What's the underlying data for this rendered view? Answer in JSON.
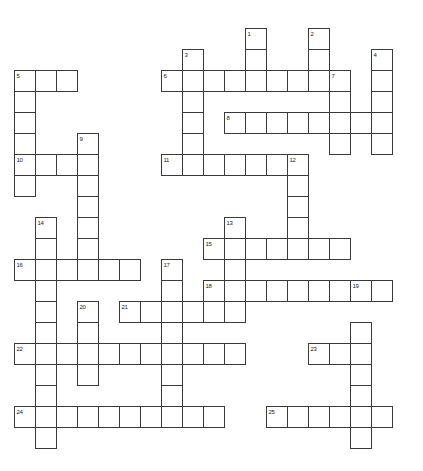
{
  "puzzle": {
    "title": "Crossword Puzzle Grid",
    "cell_size": 21,
    "origin_x": 14,
    "origin_y": 28,
    "grid_cols": 19,
    "grid_rows": 21,
    "border_color": "#3a3a3a",
    "cell_fill": "#ffffff",
    "background": "#ffffff",
    "number_color": "#1a1a1a",
    "entries": [
      {
        "number": "1",
        "direction": "down",
        "col": 11,
        "row": 0,
        "length": 2
      },
      {
        "number": "2",
        "direction": "down",
        "col": 14,
        "row": 0,
        "length": 2
      },
      {
        "number": "3",
        "direction": "down",
        "col": 8,
        "row": 1,
        "length": 5
      },
      {
        "number": "4",
        "direction": "down",
        "col": 17,
        "row": 1,
        "length": 5
      },
      {
        "number": "5",
        "direction": "across",
        "col": 0,
        "row": 2,
        "length": 3
      },
      {
        "number": "5d",
        "direction": "down",
        "col": 0,
        "row": 2,
        "length": 5
      },
      {
        "number": "6",
        "direction": "across",
        "col": 7,
        "row": 2,
        "length": 8
      },
      {
        "number": "7",
        "direction": "down",
        "col": 15,
        "row": 2,
        "length": 4
      },
      {
        "number": "8",
        "direction": "across",
        "col": 10,
        "row": 4,
        "length": 8
      },
      {
        "number": "9",
        "direction": "down",
        "col": 3,
        "row": 5,
        "length": 7
      },
      {
        "number": "10",
        "direction": "across",
        "col": 0,
        "row": 6,
        "length": 4
      },
      {
        "number": "11",
        "direction": "across",
        "col": 7,
        "row": 6,
        "length": 7
      },
      {
        "number": "12",
        "direction": "down",
        "col": 13,
        "row": 6,
        "length": 5
      },
      {
        "number": "13",
        "direction": "down",
        "col": 10,
        "row": 9,
        "length": 4
      },
      {
        "number": "14",
        "direction": "down",
        "col": 1,
        "row": 9,
        "length": 6
      },
      {
        "number": "15",
        "direction": "across",
        "col": 9,
        "row": 10,
        "length": 7
      },
      {
        "number": "16",
        "direction": "across",
        "col": 0,
        "row": 11,
        "length": 6
      },
      {
        "number": "17",
        "direction": "down",
        "col": 7,
        "row": 11,
        "length": 7
      },
      {
        "number": "18",
        "direction": "across",
        "col": 9,
        "row": 12,
        "length": 9
      },
      {
        "number": "19",
        "direction": "down",
        "col": 16,
        "row": 12,
        "length": 7
      },
      {
        "number": "20",
        "direction": "down",
        "col": 3,
        "row": 13,
        "length": 5
      },
      {
        "number": "21",
        "direction": "across",
        "col": 5,
        "row": 13,
        "length": 6
      },
      {
        "number": "22",
        "direction": "across",
        "col": 0,
        "row": 15,
        "length": 11
      },
      {
        "number": "23",
        "direction": "across",
        "col": 14,
        "row": 15,
        "length": 3
      },
      {
        "number": "24",
        "direction": "across",
        "col": 0,
        "row": 18,
        "length": 10
      },
      {
        "number": "25",
        "direction": "across",
        "col": 12,
        "row": 18,
        "length": 6
      }
    ],
    "cells": [
      {
        "col": 11,
        "row": 0,
        "number": "1"
      },
      {
        "col": 14,
        "row": 0,
        "number": "2"
      },
      {
        "col": 11,
        "row": 1
      },
      {
        "col": 14,
        "row": 1
      },
      {
        "col": 8,
        "row": 1,
        "number": "3"
      },
      {
        "col": 17,
        "row": 1,
        "number": "4"
      },
      {
        "col": 0,
        "row": 2,
        "number": "5"
      },
      {
        "col": 1,
        "row": 2
      },
      {
        "col": 2,
        "row": 2
      },
      {
        "col": 7,
        "row": 2,
        "number": "6"
      },
      {
        "col": 8,
        "row": 2
      },
      {
        "col": 9,
        "row": 2
      },
      {
        "col": 10,
        "row": 2
      },
      {
        "col": 11,
        "row": 2
      },
      {
        "col": 12,
        "row": 2
      },
      {
        "col": 13,
        "row": 2
      },
      {
        "col": 14,
        "row": 2
      },
      {
        "col": 15,
        "row": 2,
        "number": "7"
      },
      {
        "col": 17,
        "row": 2
      },
      {
        "col": 0,
        "row": 3
      },
      {
        "col": 8,
        "row": 3
      },
      {
        "col": 15,
        "row": 3
      },
      {
        "col": 17,
        "row": 3
      },
      {
        "col": 0,
        "row": 4
      },
      {
        "col": 8,
        "row": 4
      },
      {
        "col": 10,
        "row": 4,
        "number": "8"
      },
      {
        "col": 11,
        "row": 4
      },
      {
        "col": 12,
        "row": 4
      },
      {
        "col": 13,
        "row": 4
      },
      {
        "col": 14,
        "row": 4
      },
      {
        "col": 15,
        "row": 4
      },
      {
        "col": 16,
        "row": 4
      },
      {
        "col": 17,
        "row": 4
      },
      {
        "col": 0,
        "row": 5
      },
      {
        "col": 3,
        "row": 5,
        "number": "9"
      },
      {
        "col": 8,
        "row": 5
      },
      {
        "col": 15,
        "row": 5
      },
      {
        "col": 17,
        "row": 5
      },
      {
        "col": 0,
        "row": 6,
        "number": "10"
      },
      {
        "col": 1,
        "row": 6
      },
      {
        "col": 2,
        "row": 6
      },
      {
        "col": 3,
        "row": 6
      },
      {
        "col": 7,
        "row": 6,
        "number": "11"
      },
      {
        "col": 8,
        "row": 6
      },
      {
        "col": 9,
        "row": 6
      },
      {
        "col": 10,
        "row": 6
      },
      {
        "col": 11,
        "row": 6
      },
      {
        "col": 12,
        "row": 6
      },
      {
        "col": 13,
        "row": 6,
        "number": "12"
      },
      {
        "col": 0,
        "row": 7
      },
      {
        "col": 3,
        "row": 7
      },
      {
        "col": 13,
        "row": 7
      },
      {
        "col": 3,
        "row": 8
      },
      {
        "col": 13,
        "row": 8
      },
      {
        "col": 1,
        "row": 9,
        "number": "14"
      },
      {
        "col": 3,
        "row": 9
      },
      {
        "col": 10,
        "row": 9,
        "number": "13"
      },
      {
        "col": 13,
        "row": 9
      },
      {
        "col": 1,
        "row": 10
      },
      {
        "col": 3,
        "row": 10
      },
      {
        "col": 9,
        "row": 10,
        "number": "15"
      },
      {
        "col": 10,
        "row": 10
      },
      {
        "col": 11,
        "row": 10
      },
      {
        "col": 12,
        "row": 10
      },
      {
        "col": 13,
        "row": 10
      },
      {
        "col": 14,
        "row": 10
      },
      {
        "col": 15,
        "row": 10
      },
      {
        "col": 0,
        "row": 11,
        "number": "16"
      },
      {
        "col": 1,
        "row": 11
      },
      {
        "col": 2,
        "row": 11
      },
      {
        "col": 3,
        "row": 11
      },
      {
        "col": 4,
        "row": 11
      },
      {
        "col": 5,
        "row": 11
      },
      {
        "col": 7,
        "row": 11,
        "number": "17"
      },
      {
        "col": 10,
        "row": 11
      },
      {
        "col": 1,
        "row": 12
      },
      {
        "col": 7,
        "row": 12
      },
      {
        "col": 9,
        "row": 12,
        "number": "18"
      },
      {
        "col": 10,
        "row": 12
      },
      {
        "col": 11,
        "row": 12
      },
      {
        "col": 12,
        "row": 12
      },
      {
        "col": 13,
        "row": 12
      },
      {
        "col": 14,
        "row": 12
      },
      {
        "col": 15,
        "row": 12
      },
      {
        "col": 16,
        "row": 12,
        "number": "19"
      },
      {
        "col": 17,
        "row": 12
      },
      {
        "col": 1,
        "row": 13
      },
      {
        "col": 3,
        "row": 13,
        "number": "20"
      },
      {
        "col": 5,
        "row": 13,
        "number": "21"
      },
      {
        "col": 6,
        "row": 13
      },
      {
        "col": 7,
        "row": 13
      },
      {
        "col": 8,
        "row": 13
      },
      {
        "col": 9,
        "row": 13
      },
      {
        "col": 10,
        "row": 13
      },
      {
        "col": 1,
        "row": 14
      },
      {
        "col": 3,
        "row": 14
      },
      {
        "col": 7,
        "row": 14
      },
      {
        "col": 16,
        "row": 14
      },
      {
        "col": 0,
        "row": 15,
        "number": "22"
      },
      {
        "col": 1,
        "row": 15
      },
      {
        "col": 2,
        "row": 15
      },
      {
        "col": 3,
        "row": 15
      },
      {
        "col": 4,
        "row": 15
      },
      {
        "col": 5,
        "row": 15
      },
      {
        "col": 6,
        "row": 15
      },
      {
        "col": 7,
        "row": 15
      },
      {
        "col": 8,
        "row": 15
      },
      {
        "col": 9,
        "row": 15
      },
      {
        "col": 10,
        "row": 15
      },
      {
        "col": 14,
        "row": 15,
        "number": "23"
      },
      {
        "col": 15,
        "row": 15
      },
      {
        "col": 16,
        "row": 15
      },
      {
        "col": 1,
        "row": 16
      },
      {
        "col": 3,
        "row": 16
      },
      {
        "col": 7,
        "row": 16
      },
      {
        "col": 16,
        "row": 16
      },
      {
        "col": 1,
        "row": 17
      },
      {
        "col": 7,
        "row": 17
      },
      {
        "col": 16,
        "row": 17
      },
      {
        "col": 0,
        "row": 18,
        "number": "24"
      },
      {
        "col": 1,
        "row": 18
      },
      {
        "col": 2,
        "row": 18
      },
      {
        "col": 3,
        "row": 18
      },
      {
        "col": 4,
        "row": 18
      },
      {
        "col": 5,
        "row": 18
      },
      {
        "col": 6,
        "row": 18
      },
      {
        "col": 7,
        "row": 18
      },
      {
        "col": 8,
        "row": 18
      },
      {
        "col": 9,
        "row": 18
      },
      {
        "col": 12,
        "row": 18,
        "number": "25"
      },
      {
        "col": 13,
        "row": 18
      },
      {
        "col": 14,
        "row": 18
      },
      {
        "col": 15,
        "row": 18
      },
      {
        "col": 16,
        "row": 18
      },
      {
        "col": 17,
        "row": 18
      },
      {
        "col": 1,
        "row": 19
      },
      {
        "col": 16,
        "row": 19
      }
    ]
  }
}
